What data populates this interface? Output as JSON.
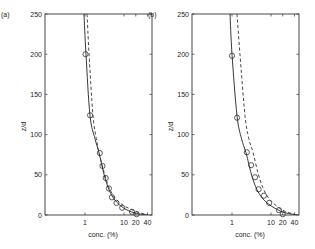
{
  "chart_data": [
    {
      "type": "scatter",
      "panel_label": "(a)",
      "title": "",
      "xlabel": "conc. (%)",
      "ylabel": "z/d",
      "xscale": "log",
      "xlim": [
        0.1,
        52
      ],
      "ylim": [
        0,
        250
      ],
      "xticks": [
        1,
        10,
        20,
        40
      ],
      "xtick_labels": [
        "1",
        "10",
        "20",
        "40"
      ],
      "yticks": [
        0,
        50,
        100,
        150,
        200,
        250
      ],
      "ytick_labels": [
        "0",
        "50",
        "100",
        "150",
        "200",
        "250"
      ],
      "grid": false,
      "legend": null,
      "series": [
        {
          "name": "measured",
          "style": "circle-markers",
          "x": [
            1.03,
            1.35,
            2.4,
            2.8,
            3.4,
            4.1,
            4.9,
            6.4,
            9.0,
            16.0,
            21.0
          ],
          "y": [
            200,
            124,
            77,
            61,
            46,
            33,
            22,
            15,
            9,
            4,
            1
          ]
        },
        {
          "name": "model (solid)",
          "style": "solid-line",
          "x": [
            0.94,
            1.06,
            1.34,
            1.8,
            2.3,
            3.26,
            4.9,
            8.9,
            19,
            41
          ],
          "y": [
            250,
            200,
            124,
            95,
            77,
            46,
            24,
            10,
            2.5,
            0
          ]
        },
        {
          "name": "model (dashed)",
          "style": "dashed-line",
          "x": [
            1.13,
            1.27,
            1.6,
            1.95,
            2.3,
            3.1,
            4.4,
            7.9,
            19,
            41
          ],
          "y": [
            250,
            200,
            124,
            95,
            77,
            53,
            31,
            15,
            5,
            0
          ]
        }
      ]
    },
    {
      "type": "scatter",
      "panel_label": "(b)",
      "title": "",
      "xlabel": "conc. (%)",
      "ylabel": "z/d",
      "xscale": "log",
      "xlim": [
        0.1,
        52
      ],
      "ylim": [
        0,
        250
      ],
      "xticks": [
        1,
        10,
        20,
        40
      ],
      "xtick_labels": [
        "1",
        "10",
        "20",
        "40"
      ],
      "yticks": [
        0,
        50,
        100,
        150,
        200,
        250
      ],
      "ytick_labels": [
        "0",
        "50",
        "100",
        "150",
        "200",
        "250"
      ],
      "grid": false,
      "legend": null,
      "series": [
        {
          "name": "measured",
          "style": "circle-markers",
          "x": [
            1.0,
            1.35,
            2.4,
            3.1,
            3.9,
            4.8,
            6.6,
            9.0,
            16.0,
            20.0
          ],
          "y": [
            198,
            121,
            78,
            62,
            47,
            32,
            24,
            15,
            6,
            1
          ]
        },
        {
          "name": "model (solid)",
          "style": "solid-line",
          "x": [
            0.89,
            1.0,
            1.34,
            1.75,
            2.3,
            3.3,
            4.9,
            8.4,
            19.4,
            47
          ],
          "y": [
            250,
            200,
            124,
            95,
            77,
            47,
            27,
            14,
            4,
            0
          ]
        },
        {
          "name": "model (dashed)",
          "style": "dashed-line",
          "x": [
            1.34,
            1.6,
            2.15,
            2.7,
            3.5,
            4.6,
            6.2,
            9.4,
            20,
            47
          ],
          "y": [
            250,
            200,
            124,
            95,
            77,
            53,
            34,
            19,
            6,
            0
          ]
        }
      ]
    }
  ],
  "layout": {
    "panels": [
      {
        "frame_left": 45,
        "frame_right": 152,
        "frame_top": 14,
        "frame_bottom": 215,
        "x_at_1": 85,
        "px_per_decade": 39
      },
      {
        "frame_left": 192,
        "frame_right": 299,
        "frame_top": 14,
        "frame_bottom": 215,
        "x_at_1": 232,
        "px_per_decade": 39
      }
    ]
  }
}
